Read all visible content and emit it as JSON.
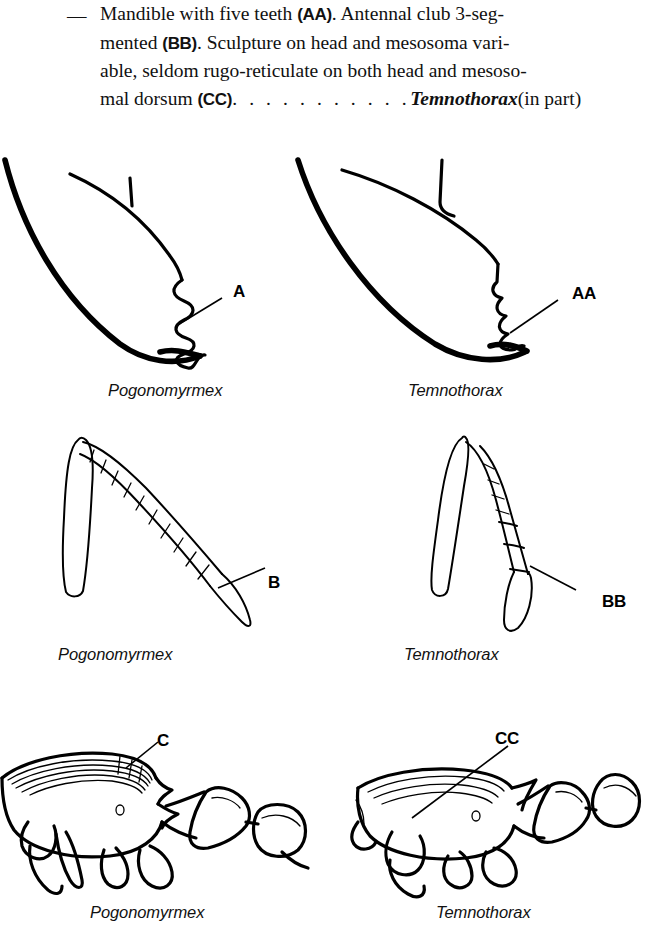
{
  "key_couplet": {
    "dash": "—",
    "line1_part1": "Mandible with five teeth ",
    "line1_label": "(AA)",
    "line1_part2": ". Antennal club 3-seg-",
    "line2_part1": "mented ",
    "line2_label": "(BB)",
    "line2_part2": ". Sculpture on head and mesosoma vari-",
    "line3": "able, seldom rugo-reticulate on both head and mesoso-",
    "line4_part1": "mal dorsum ",
    "line4_label": "(CC)",
    "line4_dots": ". . . . . . . . . . .",
    "line4_taxon": "Temnothorax",
    "line4_suffix": "(in part)",
    "full_text": "— Mandible with five teeth (AA). Antennal club 3-segmented (BB). Sculpture on head and mesosoma variable, seldom rugo-reticulate on both head and mesosomal dorsum (CC) . . . . . . . . . . . Temnothorax (in part)"
  },
  "figures": {
    "row1": {
      "structure": "mandible",
      "left": {
        "caption": "Pogonomyrmex",
        "callout": "A"
      },
      "right": {
        "caption": "Temnothorax",
        "callout": "AA"
      }
    },
    "row2": {
      "structure": "antenna",
      "left": {
        "caption": "Pogonomyrmex",
        "callout": "B"
      },
      "right": {
        "caption": "Temnothorax",
        "callout": "BB"
      }
    },
    "row3": {
      "structure": "mesosoma",
      "left": {
        "caption": "Pogonomyrmex",
        "callout": "C"
      },
      "right": {
        "caption": "Temnothorax",
        "callout": "CC"
      }
    }
  },
  "colors": {
    "ink": "#000000",
    "text": "#111111",
    "background": "#ffffff"
  }
}
